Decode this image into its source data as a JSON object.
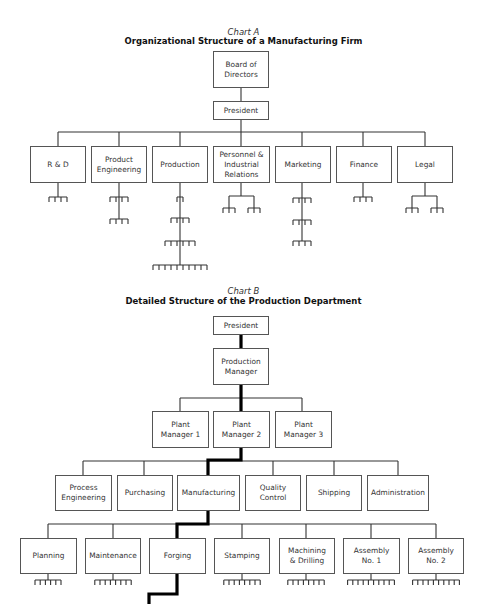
{
  "chart_a": {
    "label": "Chart A",
    "title": "Organizational Structure of a Manufacturing Firm",
    "nodes": [
      {
        "id": "board",
        "text": "Board of\nDirectors",
        "x": 213,
        "y": 51,
        "w": 56,
        "h": 37
      },
      {
        "id": "president",
        "text": "President",
        "x": 213,
        "y": 101,
        "w": 56,
        "h": 19
      },
      {
        "id": "rd",
        "text": "R & D",
        "x": 30,
        "y": 146,
        "w": 56,
        "h": 37
      },
      {
        "id": "product-engineering",
        "text": "Product\nEngineering",
        "x": 91,
        "y": 146,
        "w": 56,
        "h": 37
      },
      {
        "id": "production",
        "text": "Production",
        "x": 152,
        "y": 146,
        "w": 56,
        "h": 37
      },
      {
        "id": "personnel",
        "text": "Personnel &\nIndustrial\nRelations",
        "x": 213,
        "y": 146,
        "w": 57,
        "h": 37
      },
      {
        "id": "marketing",
        "text": "Marketing",
        "x": 275,
        "y": 146,
        "w": 56,
        "h": 37
      },
      {
        "id": "finance",
        "text": "Finance",
        "x": 336,
        "y": 146,
        "w": 56,
        "h": 37
      },
      {
        "id": "legal",
        "text": "Legal",
        "x": 397,
        "y": 146,
        "w": 56,
        "h": 37
      }
    ]
  },
  "chart_b": {
    "label": "Chart B",
    "title": "Detailed Structure of the Production Department",
    "nodes": [
      {
        "id": "president",
        "text": "President",
        "x": 213,
        "y": 316,
        "w": 56,
        "h": 19
      },
      {
        "id": "production-manager",
        "text": "Production\nManager",
        "x": 213,
        "y": 348,
        "w": 56,
        "h": 37
      },
      {
        "id": "plant-manager-1",
        "text": "Plant\nManager 1",
        "x": 152,
        "y": 411,
        "w": 57,
        "h": 37
      },
      {
        "id": "plant-manager-2",
        "text": "Plant\nManager 2",
        "x": 213,
        "y": 411,
        "w": 57,
        "h": 37
      },
      {
        "id": "plant-manager-3",
        "text": "Plant\nManager 3",
        "x": 275,
        "y": 411,
        "w": 57,
        "h": 37
      },
      {
        "id": "process-engineering",
        "text": "Process\nEngineering",
        "x": 55,
        "y": 475,
        "w": 57,
        "h": 36
      },
      {
        "id": "purchasing",
        "text": "Purchasing",
        "x": 117,
        "y": 475,
        "w": 56,
        "h": 36
      },
      {
        "id": "manufacturing",
        "text": "Manufacturing",
        "x": 177,
        "y": 475,
        "w": 63,
        "h": 36
      },
      {
        "id": "quality-control",
        "text": "Quality\nControl",
        "x": 245,
        "y": 475,
        "w": 56,
        "h": 36
      },
      {
        "id": "shipping",
        "text": "Shipping",
        "x": 306,
        "y": 475,
        "w": 56,
        "h": 36
      },
      {
        "id": "administration",
        "text": "Administration",
        "x": 367,
        "y": 475,
        "w": 62,
        "h": 36
      },
      {
        "id": "planning",
        "text": "Planning",
        "x": 20,
        "y": 538,
        "w": 57,
        "h": 36
      },
      {
        "id": "maintenance",
        "text": "Maintenance",
        "x": 85,
        "y": 538,
        "w": 56,
        "h": 36
      },
      {
        "id": "forging",
        "text": "Forging",
        "x": 149,
        "y": 538,
        "w": 57,
        "h": 36
      },
      {
        "id": "stamping",
        "text": "Stamping",
        "x": 214,
        "y": 538,
        "w": 56,
        "h": 36
      },
      {
        "id": "machining-drilling",
        "text": "Machining\n& Drilling",
        "x": 279,
        "y": 538,
        "w": 56,
        "h": 36
      },
      {
        "id": "assembly-1",
        "text": "Assembly\nNo. 1",
        "x": 343,
        "y": 538,
        "w": 57,
        "h": 36
      },
      {
        "id": "assembly-2",
        "text": "Assembly\nNo. 2",
        "x": 408,
        "y": 538,
        "w": 56,
        "h": 36
      }
    ]
  },
  "chart_data": {
    "type": "org_chart",
    "charts": [
      {
        "label": "Chart A",
        "title": "Organizational Structure of a Manufacturing Firm",
        "root": "Board of Directors",
        "hierarchy": {
          "Board of Directors": [
            "President"
          ],
          "President": [
            "R & D",
            "Product Engineering",
            "Production",
            "Personnel & Industrial Relations",
            "Marketing",
            "Finance",
            "Legal"
          ]
        },
        "unlabeled_subunit_rakes": {
          "R & D": [
            4
          ],
          "Product Engineering": [
            4,
            4
          ],
          "Production": [
            2,
            4,
            6,
            10
          ],
          "Personnel & Industrial Relations": [
            [
              3,
              3
            ]
          ],
          "Marketing": [
            4,
            4,
            4
          ],
          "Finance": [
            4
          ],
          "Legal": [
            [
              3,
              3
            ]
          ]
        }
      },
      {
        "label": "Chart B",
        "title": "Detailed Structure of the Production Department",
        "root": "President",
        "hierarchy": {
          "President": [
            "Production Manager"
          ],
          "Production Manager": [
            "Plant Manager 1",
            "Plant Manager 2",
            "Plant Manager 3"
          ],
          "Plant Manager 2": [
            "Process Engineering",
            "Purchasing",
            "Manufacturing",
            "Quality Control",
            "Shipping",
            "Administration"
          ],
          "Manufacturing": [
            "Planning",
            "Maintenance",
            "Forging",
            "Stamping",
            "Machining & Drilling",
            "Assembly No. 1",
            "Assembly No. 2"
          ]
        },
        "highlighted_path": [
          "President",
          "Production Manager",
          "Plant Manager 2",
          "Manufacturing",
          "Forging",
          "(continues below)"
        ],
        "unlabeled_subunit_rakes": {
          "Planning": 6,
          "Maintenance": 8,
          "Stamping": 8,
          "Machining & Drilling": 8,
          "Assembly No. 1": 10,
          "Assembly No. 2": 10
        }
      }
    ]
  },
  "colors": {
    "line": "#333333",
    "box_border": "#555555",
    "highlight": "#000000"
  }
}
